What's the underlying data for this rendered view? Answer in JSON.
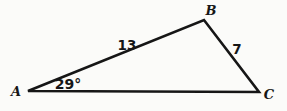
{
  "figure": {
    "background_color": "#fbfbf9",
    "line_color": "#161616",
    "vertices": {
      "A": {
        "label": "A",
        "x": 28,
        "y": 91,
        "label_x": 16,
        "label_y": 96
      },
      "B": {
        "label": "B",
        "x": 204,
        "y": 20,
        "label_x": 211,
        "label_y": 15
      },
      "C": {
        "label": "C",
        "x": 259,
        "y": 92,
        "label_x": 269,
        "label_y": 99
      }
    },
    "side_labels": [
      {
        "text": "13",
        "side": "AB",
        "x": 127,
        "y": 50
      },
      {
        "text": "7",
        "side": "BC",
        "x": 237,
        "y": 54
      }
    ],
    "angle_labels": [
      {
        "text": "29°",
        "vertex": "A",
        "x": 68,
        "y": 89
      }
    ]
  }
}
